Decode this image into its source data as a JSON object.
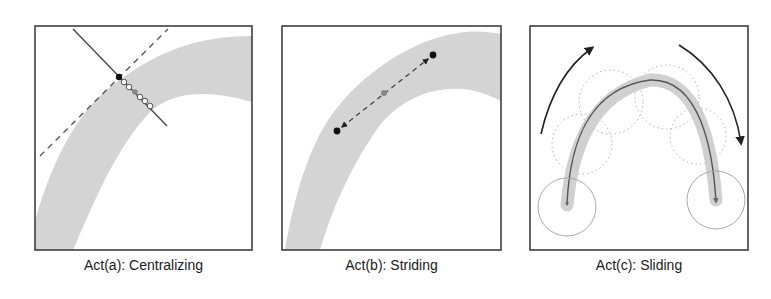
{
  "panels": [
    {
      "id": "a",
      "caption": "Act(a): Centralizing",
      "frame": {
        "x": 35,
        "y": 26,
        "w": 217,
        "h": 224
      },
      "band_outer": "M35,221 C52,160 80,105 120,80 C160,50 200,36 252,36",
      "band_inner": "M73,250 C95,200 115,150 150,112 C175,90 210,90 252,102",
      "dashed_line": {
        "x1": 40,
        "y1": 156,
        "x2": 168,
        "y2": 29
      },
      "solid_line": {
        "x1": 73,
        "y1": 29,
        "x2": 167,
        "y2": 126
      },
      "black_dot": {
        "cx": 119,
        "cy": 77
      },
      "open_circles": [
        [
          124,
          82
        ],
        [
          129,
          87
        ],
        [
          140,
          97
        ],
        [
          145,
          101
        ],
        [
          150,
          106
        ]
      ],
      "gray_dot": {
        "cx": 135,
        "cy": 92
      }
    },
    {
      "id": "b",
      "caption": "Act(b): Striding",
      "frame": {
        "x": 282,
        "y": 26,
        "w": 219,
        "h": 224
      },
      "band_outer": "M285,250 C295,190 310,150 325,125 C350,85 390,55 430,40 C460,30 480,30 501,34",
      "band_inner": "M320,250 C335,200 355,160 380,125 C405,95 440,85 470,90 C485,93 495,98 501,101",
      "dashed_line": {
        "x1": 342,
        "y1": 127,
        "x2": 428,
        "y2": 59
      },
      "black_dots": [
        [
          337,
          131
        ],
        [
          433,
          55
        ]
      ],
      "gray_dot": {
        "cx": 384,
        "cy": 93
      }
    },
    {
      "id": "c",
      "caption": "Act(c): Sliding",
      "frame": {
        "x": 530,
        "y": 26,
        "w": 218,
        "h": 224
      },
      "band_path": "M567,205 C572,150 590,95 650,80 C700,78 712,150 716,200",
      "curve_path": "M567,205 C570,140 590,88 650,80 C700,78 713,150 716,203",
      "solid_circles": [
        [
          567,
          207,
          29
        ],
        [
          716,
          200,
          29
        ]
      ],
      "dotted_circles": [
        [
          582,
          144,
          30
        ],
        [
          611,
          102,
          32
        ],
        [
          667,
          97,
          32
        ],
        [
          698,
          136,
          28
        ]
      ],
      "left_arc": "M541,134 C550,95 568,65 594,47",
      "right_arc": "M679,45 C712,65 735,100 741,145"
    }
  ],
  "colors": {
    "frame": "#333333",
    "band": "#d4d4d4",
    "line": "#444444",
    "dashed": "#555555",
    "black_dot": "#111111",
    "gray_dot": "#888888",
    "circle_outline": "#aaaaaa",
    "arrow": "#222222"
  }
}
